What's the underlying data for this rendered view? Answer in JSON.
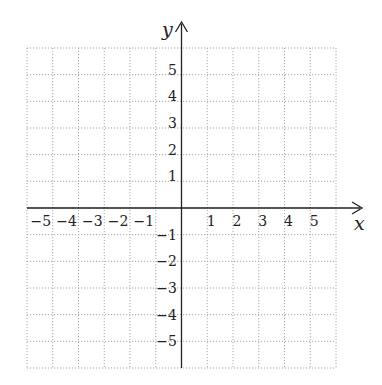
{
  "chart_data": {
    "type": "scatter",
    "title": "",
    "xlabel": "x",
    "ylabel": "y",
    "xlim": [
      -6,
      6
    ],
    "ylim": [
      -6,
      6
    ],
    "grid": true,
    "grid_style": "dotted",
    "x_ticks": [
      -5,
      -4,
      -3,
      -2,
      -1,
      1,
      2,
      3,
      4,
      5
    ],
    "y_ticks": [
      -5,
      -4,
      -3,
      -2,
      -1,
      1,
      2,
      3,
      4,
      5
    ],
    "x_tick_labels": [
      "−5",
      "−4",
      "−3",
      "−2",
      "−1",
      "1",
      "2",
      "3",
      "4",
      "5"
    ],
    "y_tick_labels": [
      "−5",
      "−4",
      "−3",
      "−2",
      "−1",
      "1",
      "2",
      "3",
      "4",
      "5"
    ],
    "series": []
  },
  "colors": {
    "axis": "#222222",
    "grid": "#a8a8a8",
    "background": "#ffffff"
  }
}
